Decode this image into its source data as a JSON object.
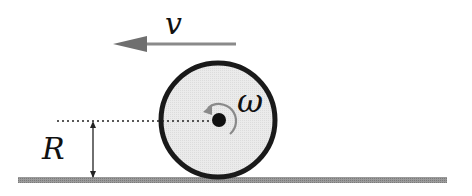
{
  "diagram": {
    "labels": {
      "velocity": "v",
      "angular_velocity": "ω",
      "radius": "R"
    },
    "colors": {
      "wheel_fill": "#e6e6e6",
      "wheel_stroke": "#1a1a1a",
      "ground": "#8a8a8a",
      "velocity_arrow": "#7a7a7a",
      "rotation_arrow": "#8a8a8a",
      "text": "#111111"
    },
    "icons": {
      "velocity": "arrow-left",
      "rotation": "counterclockwise-arc-arrow",
      "radius": "double-headed-vertical-arrow"
    }
  }
}
